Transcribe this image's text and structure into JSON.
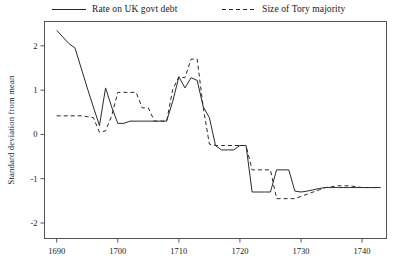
{
  "chart_data": {
    "type": "line",
    "title": "",
    "xlabel": "",
    "ylabel": "Standard deviation from mean",
    "xlim": [
      1688,
      1744
    ],
    "ylim": [
      -2.35,
      2.55
    ],
    "xticks": [
      1690,
      1700,
      1710,
      1720,
      1730,
      1740
    ],
    "yticks": [
      2,
      1,
      0,
      -1,
      -2
    ],
    "xtick_labels": [
      "1690",
      "1700",
      "1710",
      "1720",
      "1730",
      "1740"
    ],
    "ytick_labels": [
      "2",
      "1",
      "0",
      "-1",
      "-2"
    ],
    "grid": false,
    "legend_position": "above-plot",
    "series": [
      {
        "name": "Rate on UK govt debt",
        "style": "solid",
        "color": "#2a2a2a",
        "x": [
          1690,
          1691,
          1692,
          1693,
          1694,
          1695,
          1696,
          1697,
          1698,
          1699,
          1700,
          1701,
          1702,
          1703,
          1704,
          1705,
          1706,
          1707,
          1708,
          1709,
          1710,
          1711,
          1712,
          1713,
          1714,
          1715,
          1716,
          1717,
          1718,
          1719,
          1720,
          1721,
          1722,
          1723,
          1724,
          1725,
          1726,
          1727,
          1728,
          1729,
          1730,
          1731,
          1732,
          1733,
          1734,
          1735,
          1736,
          1737,
          1738,
          1739,
          1740,
          1741,
          1742,
          1743
        ],
        "values": [
          2.35,
          2.2,
          2.05,
          1.95,
          1.5,
          1.05,
          0.62,
          0.2,
          1.05,
          0.62,
          0.25,
          0.25,
          0.3,
          0.3,
          0.3,
          0.3,
          0.3,
          0.3,
          0.3,
          0.75,
          1.3,
          1.05,
          1.28,
          1.22,
          0.62,
          0.38,
          -0.25,
          -0.35,
          -0.35,
          -0.35,
          -0.25,
          -0.25,
          -1.3,
          -1.3,
          -1.3,
          -1.3,
          -0.8,
          -0.8,
          -0.8,
          -1.28,
          -1.3,
          -1.28,
          -1.25,
          -1.22,
          -1.2,
          -1.2,
          -1.2,
          -1.2,
          -1.2,
          -1.2,
          -1.2,
          -1.2,
          -1.2,
          -1.2
        ]
      },
      {
        "name": "Size of Tory majority",
        "style": "dashed",
        "color": "#2a2a2a",
        "x": [
          1690,
          1691,
          1692,
          1693,
          1694,
          1695,
          1696,
          1697,
          1698,
          1699,
          1700,
          1701,
          1702,
          1703,
          1704,
          1705,
          1706,
          1707,
          1708,
          1709,
          1710,
          1711,
          1712,
          1713,
          1714,
          1715,
          1716,
          1717,
          1718,
          1719,
          1720,
          1721,
          1722,
          1723,
          1724,
          1725,
          1726,
          1727,
          1728,
          1729,
          1730,
          1731,
          1732,
          1733,
          1734,
          1735,
          1736,
          1737,
          1738,
          1739,
          1740,
          1741,
          1742,
          1743
        ],
        "values": [
          0.42,
          0.42,
          0.42,
          0.42,
          0.42,
          0.4,
          0.38,
          0.05,
          0.08,
          0.42,
          0.95,
          0.95,
          0.95,
          0.95,
          0.6,
          0.6,
          0.3,
          0.3,
          0.3,
          1.02,
          1.3,
          1.28,
          1.7,
          1.7,
          0.6,
          -0.22,
          -0.25,
          -0.25,
          -0.25,
          -0.25,
          -0.25,
          -0.25,
          -0.8,
          -0.8,
          -0.8,
          -0.8,
          -1.45,
          -1.45,
          -1.45,
          -1.45,
          -1.4,
          -1.35,
          -1.3,
          -1.25,
          -1.2,
          -1.18,
          -1.16,
          -1.16,
          -1.16,
          -1.18,
          -1.2,
          -1.2,
          -1.2,
          -1.2
        ]
      }
    ]
  },
  "legend": {
    "entries": [
      {
        "label": "Rate on UK govt debt",
        "style": "solid"
      },
      {
        "label": "Size of Tory majority",
        "style": "dashed"
      }
    ]
  },
  "axes": {
    "y_axis_title": "Standard deviation from mean"
  }
}
